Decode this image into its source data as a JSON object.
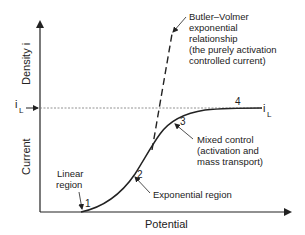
{
  "diagram": {
    "type": "polarization-curve",
    "axes": {
      "x_label": "Potential",
      "y_label_lower": "Current",
      "y_label_upper": "Density i"
    },
    "limiting_current": {
      "left_label": "i",
      "left_sub": "L",
      "right_label": "i",
      "right_sub": "L"
    },
    "annotations": {
      "butler_volmer": [
        "Butler–Volmer",
        "exponential",
        "relationship",
        "(the purely activation",
        "controlled current)"
      ],
      "mixed_control": [
        "Mixed control",
        "(activation and",
        "mass transport)"
      ],
      "linear_region": [
        "Linear",
        "region"
      ],
      "exponential_region": "Exponential region"
    },
    "points": {
      "p1": "1",
      "p2": "2",
      "p3": "3",
      "p4": "4"
    },
    "colors": {
      "line": "#222222",
      "dashed": "#333333",
      "limit_line": "#777777"
    }
  }
}
